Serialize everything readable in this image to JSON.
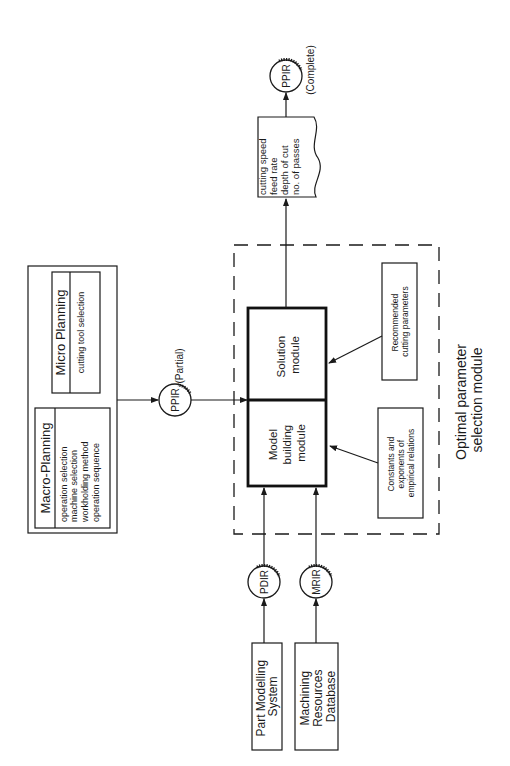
{
  "diagram": {
    "orientation": "rotated 90deg counter-clockwise",
    "sources": {
      "part_modelling": {
        "lines": [
          "Part Modelling",
          "System"
        ]
      },
      "machining_resources": {
        "lines": [
          "Machining",
          "Resources",
          "Database"
        ]
      }
    },
    "connectors": {
      "pdir": "PDIR",
      "mrir": "MRIR",
      "ppir_partial": "PPIR",
      "ppir_partial_note": "(Partial)",
      "ppir_complete": "PPIR",
      "ppir_complete_note": "(Complete)"
    },
    "planning": {
      "macro": {
        "title": "Macro-Planning",
        "items": [
          "operation selection",
          "machine selection",
          "workholding method",
          "operation sequence"
        ]
      },
      "micro": {
        "title": "Micro Planning",
        "items": [
          "cutting tool selection"
        ]
      }
    },
    "optimal_module": {
      "title_lines": [
        "Optimal parameter",
        "selection module"
      ],
      "model_building": {
        "lines": [
          "Model",
          "building",
          "module"
        ]
      },
      "solution": {
        "lines": [
          "Solution",
          "module"
        ]
      },
      "constants_note": {
        "lines": [
          "Constants and",
          "exponents of",
          "empirical relations"
        ]
      },
      "recommended_note": {
        "lines": [
          "Recommended",
          "cutting parameters"
        ]
      }
    },
    "output": {
      "lines": [
        "cutting speed",
        "feed rate",
        "depth of cut",
        "no. of passes"
      ]
    }
  }
}
